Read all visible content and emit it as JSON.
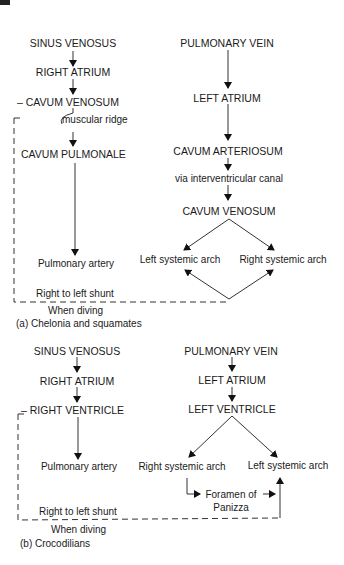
{
  "diagram_a": {
    "caption": "(a) Chelonia and squamates",
    "left_column": [
      "SINUS VENOSUS",
      "RIGHT ATRIUM",
      "– CAVUM VENOSUM",
      "muscular ridge",
      "CAVUM PULMONALE",
      "Pulmonary artery"
    ],
    "right_column": [
      "PULMONARY VEIN",
      "LEFT ATRIUM",
      "CAVUM ARTERIOSUM",
      "via interventricular canal",
      "CAVUM VENOSUM"
    ],
    "arches": [
      "Left systemic arch",
      "Right systemic arch"
    ],
    "shunt_label": "Right to left shunt",
    "diving_label": "When diving"
  },
  "diagram_b": {
    "caption": "(b) Crocodilians",
    "left_column": [
      "SINUS VENOSUS",
      "RIGHT ATRIUM",
      "– RIGHT VENTRICLE",
      "Pulmonary artery"
    ],
    "right_column": [
      "PULMONARY VEIN",
      "LEFT ATRIUM",
      "LEFT VENTRICLE"
    ],
    "arches": [
      "Right systemic arch",
      "Left systemic arch"
    ],
    "foramen_line1": "Foramen of",
    "foramen_line2": "Panizza",
    "shunt_label": "Right to left shunt",
    "diving_label": "When diving"
  }
}
